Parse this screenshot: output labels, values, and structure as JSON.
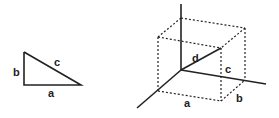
{
  "triangle_2d": {
    "labels": {
      "a": "a",
      "b": "b",
      "c": "c"
    }
  },
  "box_3d": {
    "labels": {
      "a": "a",
      "b": "b",
      "c": "c",
      "d": "d"
    }
  },
  "colors": {
    "stroke": "#222222",
    "background": "#ffffff"
  }
}
